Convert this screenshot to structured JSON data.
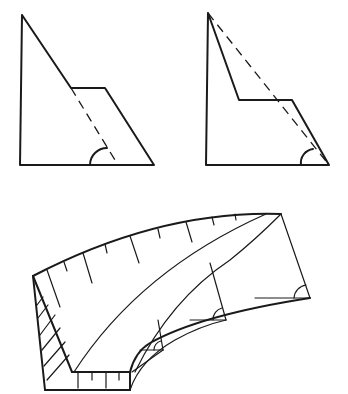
{
  "figure": {
    "colors": {
      "stroke": "#1a1a1a",
      "background": "#ffffff"
    },
    "panels": [
      {
        "id": "top-left",
        "shape": "right triangle with stepped notch, dashed continuation of hypotenuse",
        "angle_marker": true
      },
      {
        "id": "top-right",
        "shape": "right triangle with stepped notch, dashed hypotenuse from apex to base corner",
        "angle_marker": true
      },
      {
        "id": "bottom",
        "shape": "curved banked wedge in perspective with tick marks along top edge, hatched side face, three angle markers",
        "angle_markers": 3
      }
    ]
  }
}
